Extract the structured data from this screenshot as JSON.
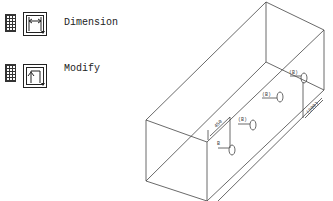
{
  "palette": {
    "tools": [
      {
        "label": "Dimension",
        "icon": "dimension-icon"
      },
      {
        "label": "Modify",
        "icon": "modify-icon"
      }
    ]
  },
  "drawing": {
    "type": "isometric wireframe box with hole markers",
    "hole_labels": [
      "(B)",
      "(B)",
      "(B)",
      "B"
    ],
    "dimension_labels": [
      "450",
      "(300)"
    ]
  }
}
